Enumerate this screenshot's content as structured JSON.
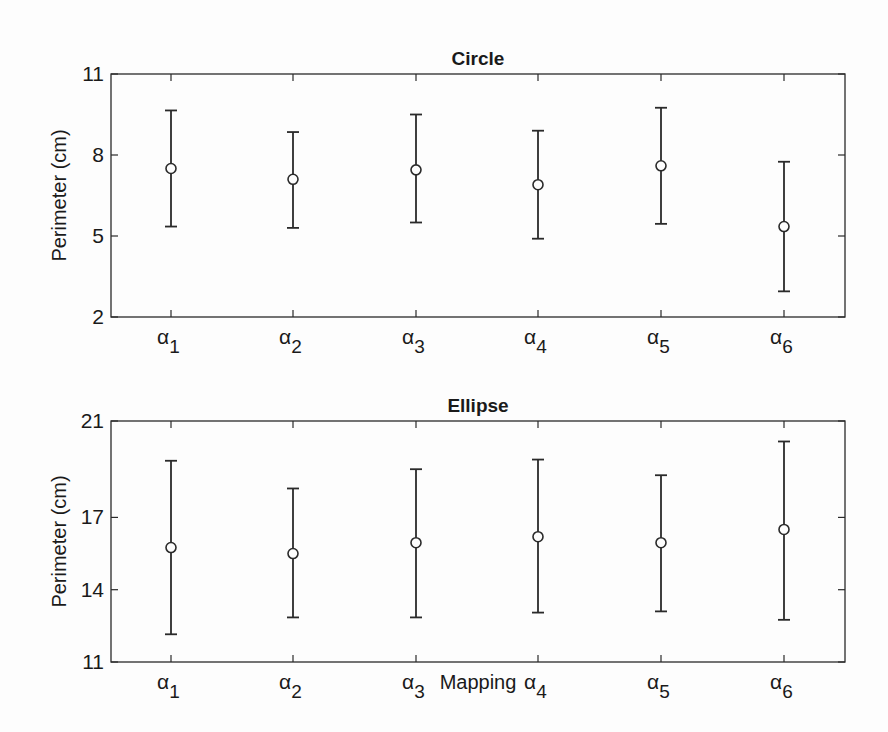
{
  "chart_data": [
    {
      "type": "errorbar",
      "title": "Circle",
      "xlabel": "",
      "ylabel": "Perimeter (cm)",
      "categories": [
        "α1",
        "α2",
        "α3",
        "α4",
        "α5",
        "α6"
      ],
      "yticks": [
        2,
        5,
        8,
        11
      ],
      "ylim": [
        2,
        11
      ],
      "mean": [
        7.5,
        7.1,
        7.45,
        6.9,
        7.6,
        5.35
      ],
      "upper": [
        9.65,
        8.85,
        9.5,
        8.9,
        9.75,
        7.75
      ],
      "lower": [
        5.35,
        5.3,
        5.5,
        4.9,
        5.45,
        2.95
      ],
      "grid": false
    },
    {
      "type": "errorbar",
      "title": "Ellipse",
      "xlabel": "Mapping",
      "ylabel": "Perimeter (cm)",
      "categories": [
        "α1",
        "α2",
        "α3",
        "α4",
        "α5",
        "α6"
      ],
      "yticks": [
        11,
        14,
        17,
        21
      ],
      "ylim": [
        11,
        21
      ],
      "mean": [
        15.75,
        15.5,
        15.95,
        16.2,
        15.95,
        16.5
      ],
      "upper": [
        19.35,
        18.2,
        19.0,
        19.4,
        18.75,
        20.15
      ],
      "lower": [
        12.15,
        12.85,
        12.85,
        13.05,
        13.1,
        12.75
      ],
      "grid": false
    }
  ],
  "labels": {
    "top_title": "Circle",
    "bottom_title": "Ellipse",
    "ylabel": "Perimeter (cm)",
    "xlabel": "Mapping",
    "alpha": "α",
    "subs": [
      "1",
      "2",
      "3",
      "4",
      "5",
      "6"
    ]
  }
}
